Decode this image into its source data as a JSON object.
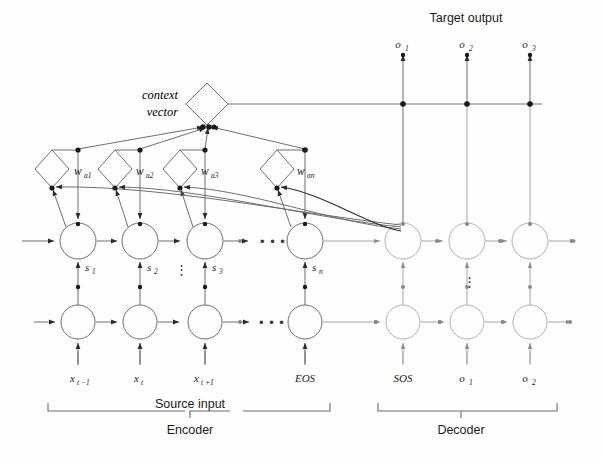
{
  "figure": {
    "context_label_line1": "context",
    "context_label_line2": "vector",
    "target_output_label": "Target output"
  },
  "target_outputs": [
    {
      "base": "o",
      "sub": "1"
    },
    {
      "base": "o",
      "sub": "2"
    },
    {
      "base": "o",
      "sub": "3"
    }
  ],
  "attention_weights": [
    {
      "base": "w",
      "sub": "a1"
    },
    {
      "base": "w",
      "sub": "a2"
    },
    {
      "base": "w",
      "sub": "a3"
    },
    {
      "base": "w",
      "sub": "an"
    }
  ],
  "hidden_states": [
    {
      "base": "s",
      "sub": "1"
    },
    {
      "base": "s",
      "sub": "2"
    },
    {
      "base": "s",
      "sub": "3"
    },
    {
      "base": "s",
      "sub": "n"
    }
  ],
  "input_labels": [
    {
      "base": "x",
      "sub": "t −1"
    },
    {
      "base": "x",
      "sub": "t"
    },
    {
      "base": "x",
      "sub": "t +1"
    },
    {
      "base": "EOS",
      "sub": ""
    },
    {
      "base": "SOS",
      "sub": ""
    },
    {
      "base": "o",
      "sub": "1"
    },
    {
      "base": "o",
      "sub": "2"
    }
  ],
  "ellipsis": {
    "horizontal": "• • •",
    "vertical": "⋮"
  },
  "brackets": [
    {
      "name": "source-input",
      "span_label": "Source input",
      "group_label": "Encoder"
    },
    {
      "name": "decoder",
      "span_label": "",
      "group_label": "Decoder"
    }
  ],
  "colors": {
    "background": "#fefefe",
    "line": "#6e6e6e",
    "line_dark": "#2b2b2b",
    "line_light": "#a6a6a6",
    "text": "#1b1b1b"
  }
}
